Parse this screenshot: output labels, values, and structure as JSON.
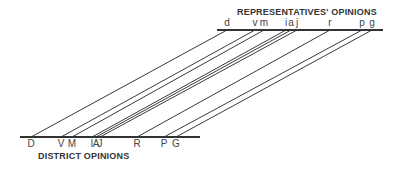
{
  "chart_data": {
    "type": "parallel-line-mapping",
    "title": "",
    "top_axis": {
      "title": "REPRESENTATIVES' OPINIONS",
      "x_start": 217,
      "x_end": 383,
      "y": 30,
      "points": [
        {
          "label": "d",
          "x": 227
        },
        {
          "label": "v",
          "x": 255
        },
        {
          "label": "m",
          "x": 264
        },
        {
          "label": "i",
          "x": 286
        },
        {
          "label": "a",
          "x": 291
        },
        {
          "label": "j",
          "x": 297
        },
        {
          "label": "r",
          "x": 330
        },
        {
          "label": "p",
          "x": 362
        },
        {
          "label": "g",
          "x": 372
        }
      ]
    },
    "bottom_axis": {
      "title": "DISTRICT OPINIONS",
      "x_start": 20,
      "x_end": 200,
      "y": 137,
      "points": [
        {
          "label": "D",
          "x": 31
        },
        {
          "label": "V",
          "x": 61
        },
        {
          "label": "M",
          "x": 72
        },
        {
          "label": "I",
          "x": 92
        },
        {
          "label": "A",
          "x": 96
        },
        {
          "label": "J",
          "x": 100
        },
        {
          "label": "R",
          "x": 137
        },
        {
          "label": "P",
          "x": 164
        },
        {
          "label": "G",
          "x": 176
        }
      ]
    },
    "links": [
      {
        "from": "D",
        "to": "d"
      },
      {
        "from": "V",
        "to": "v"
      },
      {
        "from": "M",
        "to": "m"
      },
      {
        "from": "I",
        "to": "i"
      },
      {
        "from": "A",
        "to": "a"
      },
      {
        "from": "J",
        "to": "j"
      },
      {
        "from": "R",
        "to": "r"
      },
      {
        "from": "P",
        "to": "p"
      },
      {
        "from": "G",
        "to": "g"
      }
    ]
  },
  "labels": {
    "top_title": "REPRESENTATIVES' OPINIONS",
    "bottom_title": "DISTRICT OPINIONS"
  }
}
